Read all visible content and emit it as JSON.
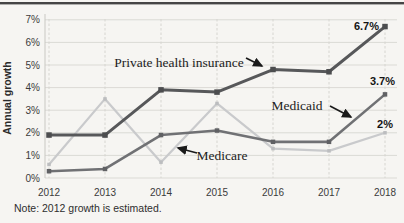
{
  "figure": {
    "background": "#f6f5f2",
    "top_rule_color": "#454545"
  },
  "chart_data": {
    "type": "line",
    "title": "",
    "ylabel": "Annual growth",
    "xlabel": "",
    "x_labels": [
      "2012",
      "2013",
      "2014",
      "2015",
      "2016",
      "2017",
      "2018"
    ],
    "y_ticks": [
      "0%",
      "1%",
      "2%",
      "3%",
      "4%",
      "5%",
      "6%",
      "7%"
    ],
    "ylim": [
      0,
      7
    ],
    "grid": true,
    "legend_position": "inline-annotations",
    "note": "Note: 2012 growth is estimated.",
    "series": [
      {
        "name": "Private health insurance",
        "values": [
          1.9,
          1.9,
          3.9,
          3.8,
          4.8,
          4.7,
          6.7
        ],
        "color": "#57585a",
        "marker_color": "#4c4d4f",
        "line_width": 3,
        "marker_size": 5.5,
        "end_label": "6.7%"
      },
      {
        "name": "Medicaid",
        "values": [
          0.3,
          0.4,
          1.9,
          2.1,
          1.6,
          1.6,
          3.7
        ],
        "color": "#707174",
        "marker_color": "#606164",
        "line_width": 2.6,
        "marker_size": 4.5,
        "end_label": "3.7%"
      },
      {
        "name": "Medicare",
        "values": [
          0.6,
          3.5,
          0.7,
          3.3,
          1.3,
          1.2,
          2.0
        ],
        "color": "#c9cacc",
        "marker_color": "#bcbdbf",
        "line_width": 2.2,
        "marker_size": 3.5,
        "end_label": "2%"
      }
    ],
    "end_label_color": "#141414",
    "annotations": [
      {
        "text": "Private health insurance",
        "x": 179,
        "y": 67,
        "arrow": {
          "x1": 246,
          "y1": 58,
          "x2": 262,
          "y2": 66
        }
      },
      {
        "text": "Medicaid",
        "x": 297,
        "y": 110,
        "arrow": {
          "x1": 330,
          "y1": 106,
          "x2": 351,
          "y2": 117
        }
      },
      {
        "text": "Medicare",
        "x": 222,
        "y": 160,
        "arrow": {
          "x1": 197,
          "y1": 153,
          "x2": 178,
          "y2": 148
        }
      }
    ]
  }
}
